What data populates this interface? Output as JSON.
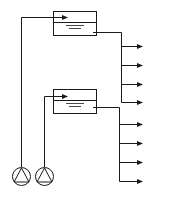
{
  "diagram": {
    "title": "",
    "stroke_color": "#1a1a1a",
    "background": "#ffffff",
    "tanks": [
      {
        "id": "tank-upper",
        "x": 53,
        "y": 11,
        "w": 43,
        "h": 24,
        "divider_y": 22,
        "inlet_y": 17,
        "outlet_y": 32
      },
      {
        "id": "tank-lower",
        "x": 53,
        "y": 89,
        "w": 43,
        "h": 24,
        "divider_y": 100,
        "inlet_y": 96,
        "outlet_y": 107
      }
    ],
    "pumps": [
      {
        "id": "pump-1",
        "cx": 21,
        "cy": 176,
        "r": 9
      },
      {
        "id": "pump-2",
        "cx": 44,
        "cy": 176,
        "r": 9
      }
    ],
    "outlets": [
      {
        "group": "upper",
        "trunk_x": 121,
        "ys": [
          46,
          65,
          84,
          102
        ]
      },
      {
        "group": "lower",
        "trunk_x": 121,
        "ys": [
          124,
          143,
          162,
          181
        ]
      }
    ],
    "labels": []
  }
}
